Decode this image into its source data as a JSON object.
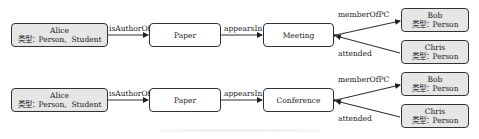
{
  "diagrams": [
    {
      "nodes": {
        "alice": {
          "name": "Alice",
          "type": "类型：Person、Student"
        },
        "paper": {
          "name": "Paper"
        },
        "venue": {
          "name": "Meeting"
        },
        "bob": {
          "name": "Bob",
          "type": "类型：Person"
        },
        "chris": {
          "name": "Chris",
          "type": "类型：Person"
        }
      },
      "edges": {
        "is_author_of": "isAuthorOf",
        "appears_in": "appearsIn",
        "member_of_pc": "memberOfPC",
        "attended": "attended"
      }
    },
    {
      "nodes": {
        "alice": {
          "name": "Alice",
          "type": "类型：Person、Student"
        },
        "paper": {
          "name": "Paper"
        },
        "venue": {
          "name": "Conference"
        },
        "bob": {
          "name": "Bob",
          "type": "类型：Person"
        },
        "chris": {
          "name": "Chris",
          "type": "类型：Person"
        }
      },
      "edges": {
        "is_author_of": "isAuthorOf",
        "appears_in": "appearsIn",
        "member_of_pc": "memberOfPC",
        "attended": "attended"
      }
    }
  ],
  "colors": {
    "entity_fill": "#e6e6e6",
    "node_fill": "#ffffff",
    "stroke": "#333333"
  }
}
